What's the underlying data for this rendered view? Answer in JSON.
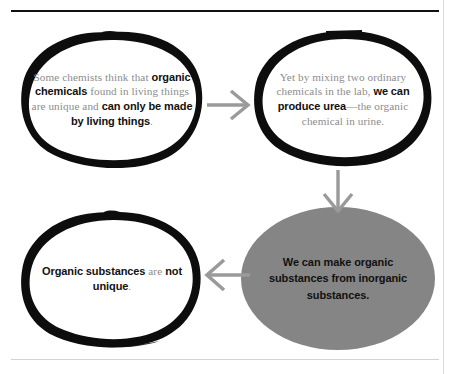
{
  "diagram": {
    "title": "Organic substances are not unique",
    "accent_gray": "#858585",
    "text_gray": "#8c8c8c",
    "text_black": "#111111",
    "arrow_gray": "#9a9a9a",
    "nodes": [
      {
        "id": "premise",
        "style": "hand-drawn-outline",
        "segments": [
          {
            "text": "Some chemists think that ",
            "bold": false
          },
          {
            "text": "organic chemicals",
            "bold": true
          },
          {
            "text": " found in living things are unique and ",
            "bold": false
          },
          {
            "text": "can only be made by living things",
            "bold": true
          },
          {
            "text": ".",
            "bold": false
          }
        ]
      },
      {
        "id": "evidence",
        "style": "hand-drawn-outline",
        "segments": [
          {
            "text": "Yet by mixing two ordinary chemicals in the lab, ",
            "bold": false
          },
          {
            "text": "we can produce urea",
            "bold": true
          },
          {
            "text": "—the organic chemical in urine.",
            "bold": false
          }
        ]
      },
      {
        "id": "claim",
        "style": "gray-filled-oval",
        "segments": [
          {
            "text": "We can make organic substances from inorganic substances.",
            "bold": true
          }
        ]
      },
      {
        "id": "conclusion",
        "style": "hand-drawn-outline",
        "segments": [
          {
            "text": "Organic substances",
            "bold": true
          },
          {
            "text": " are ",
            "bold": false
          },
          {
            "text": "not unique",
            "bold": true
          },
          {
            "text": ".",
            "bold": false
          }
        ]
      }
    ],
    "arrows": [
      {
        "id": "premise-to-evidence",
        "direction": "right"
      },
      {
        "id": "evidence-to-claim",
        "direction": "down"
      },
      {
        "id": "claim-to-conclusion",
        "direction": "left"
      }
    ],
    "rules": [
      {
        "id": "top-rule",
        "color": "#111111"
      },
      {
        "id": "bottom-rule",
        "color": "#d2d2d2"
      },
      {
        "id": "right-margin-rule",
        "color": "#dcdcdc"
      }
    ]
  }
}
